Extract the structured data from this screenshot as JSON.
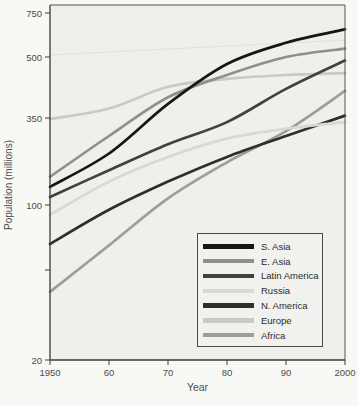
{
  "chart_data": {
    "type": "line",
    "title": "",
    "xlabel": "Year",
    "ylabel": "Population (millions)",
    "yscale": "log",
    "ylim": [
      20,
      780
    ],
    "grid": false,
    "legend_position": "lower right",
    "x": [
      1950,
      1960,
      1970,
      1980,
      1990,
      2000
    ],
    "x_ticks": [
      {
        "value": 1950,
        "label": "1950"
      },
      {
        "value": 1960,
        "label": "60"
      },
      {
        "value": 1970,
        "label": "70"
      },
      {
        "value": 1980,
        "label": "80"
      },
      {
        "value": 1990,
        "label": "90"
      },
      {
        "value": 2000,
        "label": "2000"
      }
    ],
    "y_ticks": [
      {
        "value": 750,
        "label": "750"
      },
      {
        "value": 500,
        "label": "500"
      },
      {
        "value": 350,
        "label": "350"
      },
      {
        "value": 100,
        "label": "100"
      },
      {
        "value": 50,
        "label": ""
      },
      {
        "value": 20,
        "label": "20"
      }
    ],
    "series": [
      {
        "name": "S. Asia",
        "color": "#161616",
        "values": [
          130,
          210,
          380,
          480,
          570,
          645
        ]
      },
      {
        "name": "E. Asia",
        "color": "#8f8f8f",
        "values": [
          150,
          270,
          395,
          450,
          500,
          540
        ]
      },
      {
        "name": "Latin America",
        "color": "#414141",
        "values": [
          112,
          165,
          240,
          330,
          415,
          490
        ]
      },
      {
        "name": "Russia",
        "color": "#d9d9d1",
        "values": [
          90,
          140,
          200,
          260,
          300,
          330
        ]
      },
      {
        "name": "N. America",
        "color": "#2e2e2e",
        "values": [
          66,
          95,
          140,
          200,
          270,
          355
        ]
      },
      {
        "name": "Europe",
        "color": "#c9c9c5",
        "values": [
          345,
          370,
          420,
          440,
          450,
          455
        ]
      },
      {
        "name": "Africa",
        "color": "#9d9d9d",
        "values": [
          40,
          65,
          110,
          185,
          290,
          410
        ]
      }
    ]
  }
}
